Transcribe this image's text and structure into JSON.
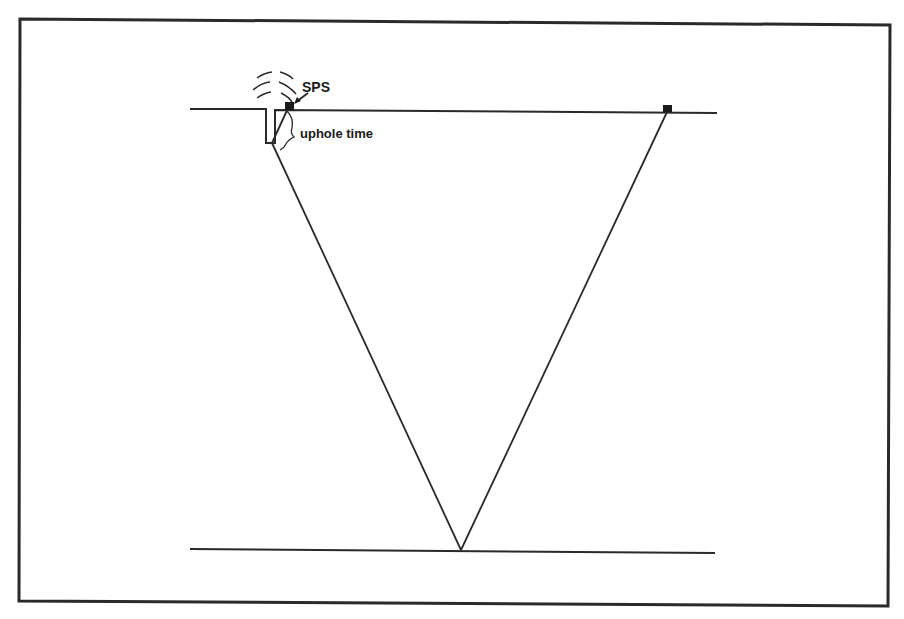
{
  "diagram": {
    "type": "seismic-reflection-raypath",
    "labels": {
      "source": "SPS",
      "annotation": "uphole time"
    },
    "elements": {
      "surface_line": "ground surface",
      "reflector_line": "reflector",
      "source_marker": "shot point (in borehole)",
      "receiver_marker": "geophone",
      "raypaths": [
        "downgoing ray",
        "upgoing ray"
      ]
    },
    "colors": {
      "ink": "#2a2a2a",
      "background": "#ffffff"
    }
  }
}
